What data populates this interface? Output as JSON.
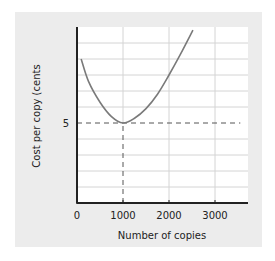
{
  "chart_data": {
    "type": "line",
    "title": "",
    "xlabel": "Number of copies",
    "ylabel": "Cost per copy (cents",
    "xlim": [
      0,
      3700
    ],
    "ylim": [
      0,
      11
    ],
    "x_ticks": [
      0,
      1000,
      2000,
      3000
    ],
    "x_tick_labels": [
      "0",
      "1000",
      "2000",
      "3000"
    ],
    "y_ticks": [
      5
    ],
    "y_tick_labels": [
      "5"
    ],
    "grid": true,
    "grid_y_step": 1,
    "grid_x_step": 1000,
    "legend": null,
    "series": [
      {
        "name": "Average cost curve",
        "x": [
          90,
          250,
          500,
          750,
          1000,
          1250,
          1500,
          1750,
          2000,
          2250,
          2520
        ],
        "y": [
          9.0,
          7.6,
          6.3,
          5.4,
          5.0,
          5.3,
          5.9,
          6.8,
          8.0,
          9.3,
          10.8
        ]
      }
    ],
    "annotations": [
      {
        "type": "hline-dashed",
        "y": 5,
        "x_from": 0,
        "x_to": 3550
      },
      {
        "type": "vline-dashed",
        "x": 1000,
        "y_from": 0,
        "y_to": 5
      }
    ]
  },
  "colors": {
    "panel_bg": "#ececec",
    "plot_bg": "#ffffff",
    "grid": "#d4d4d4",
    "axis": "#222222",
    "curve": "#7a7a7a",
    "dash": "#555555"
  }
}
